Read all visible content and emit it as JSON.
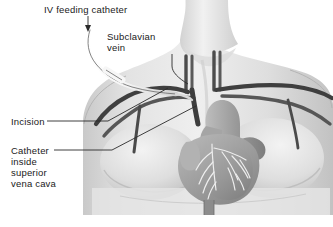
{
  "figure": {
    "background_color": "#ffffff",
    "illustration_style": "grayscale anatomical illustration",
    "palette": {
      "skin_light": "#e9e9e9",
      "skin_mid": "#d6d6d6",
      "skin_shadow": "#bdbdbd",
      "vessel_dark": "#4a4a4a",
      "vessel_outline": "#2e2e2e",
      "heart_mid": "#a8a8a8",
      "heart_dark": "#8f8f8f",
      "heart_light": "#c4c4c4",
      "coronary_light": "#efefef",
      "catheter_fill": "#f4f4f4",
      "catheter_outline": "#6b6b6b",
      "label_text": "#1a1a1a",
      "leader_line": "#2b2b2b"
    }
  },
  "labels": {
    "iv_catheter": "IV feeding catheter",
    "subclavian_line1": "Subclavian",
    "subclavian_line2": "vein",
    "incision": "Incision",
    "catheter_line1": "Catheter",
    "catheter_line2": "inside",
    "catheter_line3": "superior",
    "catheter_line4": "vena cava"
  },
  "annotations": {
    "iv_catheter_marker": "down-arrow",
    "subclavian_leader": "vertical-then-diagonal leader line",
    "incision_leader": "horizontal leader line to diagonal",
    "catheter_leader": "horizontal leader line to diagonal"
  },
  "anatomy": {
    "parts": [
      "neck",
      "shoulders",
      "chest",
      "breasts",
      "heart",
      "aortic arch",
      "superior vena cava",
      "subclavian vein",
      "jugular veins",
      "carotid arteries",
      "coronary arteries",
      "inferior vena cava"
    ]
  }
}
